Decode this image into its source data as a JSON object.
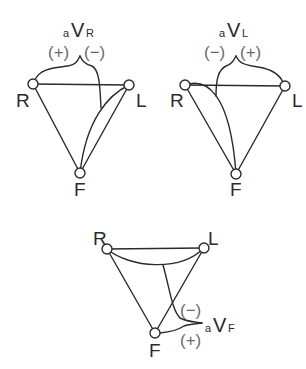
{
  "diagrams": [
    {
      "id": "aVR",
      "lead": {
        "prefix": "a",
        "main": "V",
        "sub": "R"
      },
      "polarity_left": "(+)",
      "polarity_right": "(−)",
      "electrodes": {
        "R": "R",
        "L": "L",
        "F": "F"
      }
    },
    {
      "id": "aVL",
      "lead": {
        "prefix": "a",
        "main": "V",
        "sub": "L"
      },
      "polarity_left": "(−)",
      "polarity_right": "(+)",
      "electrodes": {
        "R": "R",
        "L": "L",
        "F": "F"
      }
    },
    {
      "id": "aVF",
      "lead": {
        "prefix": "a",
        "main": "V",
        "sub": "F"
      },
      "polarity_top": "(−)",
      "polarity_bottom": "(+)",
      "electrodes": {
        "R": "R",
        "L": "L",
        "F": "F"
      }
    }
  ],
  "colors": {
    "stroke": "#2a2a2a",
    "polarity": "#6a6a6a",
    "background": "#ffffff"
  }
}
